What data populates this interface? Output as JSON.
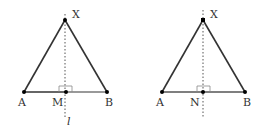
{
  "figures": [
    {
      "id": "left",
      "points": {
        "X": {
          "label": "X",
          "x": 65,
          "y": 20
        },
        "A": {
          "label": "A",
          "x": 24,
          "y": 92
        },
        "B": {
          "label": "B",
          "x": 107,
          "y": 92
        },
        "M": {
          "label": "M",
          "x": 66,
          "y": 92
        }
      },
      "line_label": "l"
    },
    {
      "id": "right",
      "points": {
        "X": {
          "label": "X",
          "x": 203,
          "y": 20
        },
        "A": {
          "label": "A",
          "x": 162,
          "y": 92
        },
        "B": {
          "label": "B",
          "x": 245,
          "y": 92
        },
        "N": {
          "label": "N",
          "x": 203,
          "y": 92
        }
      }
    }
  ],
  "colors": {
    "stroke": "#333333",
    "dotted": "#555555",
    "right_angle": "#888888",
    "base_gray": "#777777"
  }
}
